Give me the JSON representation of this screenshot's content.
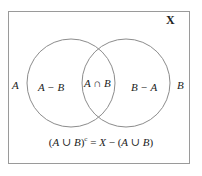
{
  "figure": {
    "kind": "venn-diagram",
    "universe_label": "X",
    "left_set_label": "A",
    "right_set_label": "B",
    "regions": {
      "left_only": "A − B",
      "intersection": "A ∩ B",
      "right_only": "B − A"
    },
    "complement_formula": {
      "full": "(A ∪ B)c = X − (A ∪ B)",
      "lhs_open": "(",
      "lhs_a": "A",
      "lhs_union": " ∪ ",
      "lhs_b": "B",
      "lhs_close": ")",
      "lhs_superscript": "c",
      "equals": " = ",
      "rhs_x": "X",
      "rhs_minus": " − ",
      "rhs_open": "(",
      "rhs_a": "A",
      "rhs_union": " ∪ ",
      "rhs_b": "B",
      "rhs_close": ")"
    }
  },
  "colors": {
    "background": "#ffffff",
    "box_stroke": "#9a9a9a",
    "circle_stroke": "#8c8c8c",
    "text": "#222222"
  }
}
